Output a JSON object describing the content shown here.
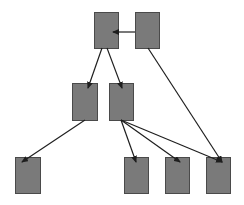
{
  "diagram": {
    "type": "tree",
    "colors": {
      "node_fill": "#7a7a7a",
      "node_stroke": "#4a4a4a",
      "edge": "#1e1e1e",
      "background": "#ffffff"
    },
    "nodes": [
      {
        "id": "n1",
        "x": 94,
        "y": 12,
        "w": 24,
        "h": 36
      },
      {
        "id": "n2",
        "x": 135,
        "y": 12,
        "w": 24,
        "h": 36
      },
      {
        "id": "n3",
        "x": 72,
        "y": 83,
        "w": 25,
        "h": 37
      },
      {
        "id": "n4",
        "x": 109,
        "y": 83,
        "w": 24,
        "h": 37
      },
      {
        "id": "n5",
        "x": 15,
        "y": 157,
        "w": 25,
        "h": 36
      },
      {
        "id": "n6",
        "x": 124,
        "y": 157,
        "w": 24,
        "h": 36
      },
      {
        "id": "n7",
        "x": 165,
        "y": 157,
        "w": 24,
        "h": 36
      },
      {
        "id": "n8",
        "x": 206,
        "y": 157,
        "w": 24,
        "h": 36
      }
    ],
    "edges": [
      {
        "from": "n2",
        "to": "n1",
        "x1": 135,
        "y1": 32,
        "x2": 113,
        "y2": 32
      },
      {
        "from": "n1",
        "to": "n3",
        "x1": 102,
        "y1": 48,
        "x2": 88,
        "y2": 88
      },
      {
        "from": "n1",
        "to": "n4",
        "x1": 107,
        "y1": 48,
        "x2": 122,
        "y2": 88
      },
      {
        "from": "n2",
        "to": "n8",
        "x1": 148,
        "y1": 48,
        "x2": 222,
        "y2": 162
      },
      {
        "from": "n3",
        "to": "n5",
        "x1": 85,
        "y1": 120,
        "x2": 22,
        "y2": 162
      },
      {
        "from": "n4",
        "to": "n6",
        "x1": 121,
        "y1": 120,
        "x2": 136,
        "y2": 162
      },
      {
        "from": "n4",
        "to": "n7",
        "x1": 121,
        "y1": 120,
        "x2": 180,
        "y2": 162
      },
      {
        "from": "n4",
        "to": "n8",
        "x1": 121,
        "y1": 120,
        "x2": 222,
        "y2": 162
      }
    ]
  }
}
